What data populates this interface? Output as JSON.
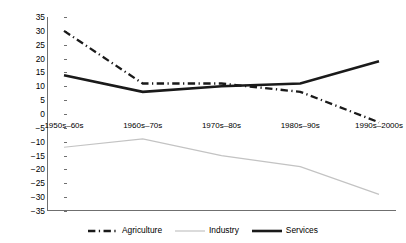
{
  "chart_data": {
    "type": "line",
    "title": "",
    "xlabel": "",
    "ylabel": "Percentage change in share",
    "categories": [
      "1950s–60s",
      "1960s–70s",
      "1970s–80s",
      "1980s–90s",
      "1990s–2000s"
    ],
    "ylim": [
      -35,
      35
    ],
    "yticks": [
      35,
      30,
      25,
      20,
      15,
      10,
      5,
      0,
      -5,
      -10,
      -15,
      -20,
      -25,
      -30,
      -35
    ],
    "ytick_labels": [
      "35",
      "30",
      "25",
      "20",
      "15",
      "10",
      "5",
      "0",
      "−5",
      "−10",
      "−15",
      "−20",
      "−25",
      "−30",
      "−35"
    ],
    "grid": false,
    "legend_position": "bottom",
    "series": [
      {
        "name": "Agriculture",
        "style": "dash-dot",
        "color": "#1a1a1a",
        "width": 2.3,
        "values": [
          30,
          11,
          11,
          8,
          -3
        ]
      },
      {
        "name": "Industry",
        "style": "solid-thin",
        "color": "#c3c3c3",
        "width": 1.2,
        "values": [
          -12,
          -9,
          -15,
          -19,
          -29
        ]
      },
      {
        "name": "Services",
        "style": "solid-thick",
        "color": "#1a1a1a",
        "width": 2.6,
        "values": [
          14,
          8,
          10,
          11,
          19
        ]
      }
    ]
  },
  "axis": {
    "line_color": "#6f6f6f"
  }
}
